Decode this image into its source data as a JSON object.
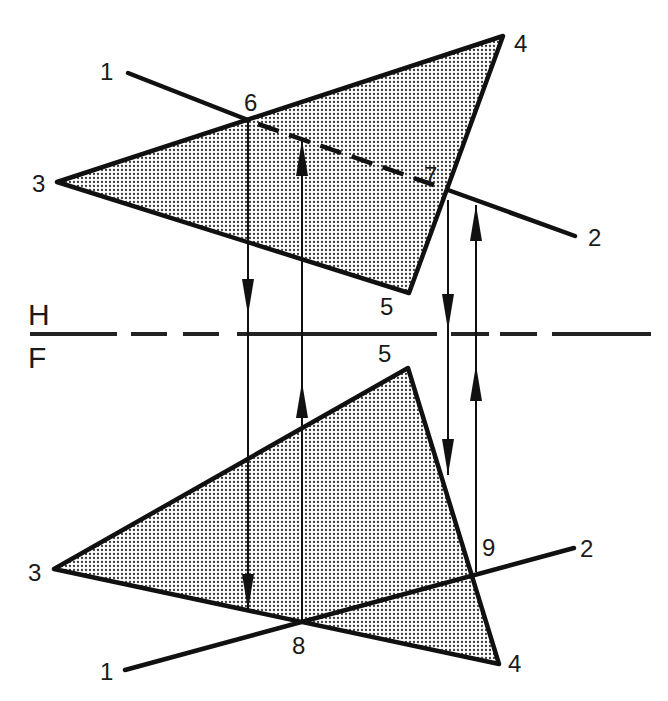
{
  "colors": {
    "ink": "#111111",
    "background": "#ffffff",
    "plane_fill_dot": "#3a3a3a"
  },
  "fold_line": {
    "upper_label": "H",
    "lower_label": "F",
    "y": 334,
    "dashes": [
      [
        30,
        117
      ],
      [
        131,
        167
      ],
      [
        183,
        219
      ],
      [
        237,
        437
      ],
      [
        451,
        489
      ],
      [
        500,
        537
      ],
      [
        552,
        651
      ]
    ]
  },
  "top_view": {
    "view_name": "H",
    "plane": {
      "vertices": {
        "3": [
          57,
          182
        ],
        "4": [
          503,
          36
        ],
        "5": [
          409,
          293
        ]
      },
      "labels": {
        "3": {
          "text": "3",
          "x": 32,
          "y": 192
        },
        "4": {
          "text": "4",
          "x": 514,
          "y": 52
        },
        "5": {
          "text": "5",
          "x": 380,
          "y": 315
        }
      }
    },
    "line": {
      "start": [
        128,
        73
      ],
      "pierce_6": [
        248,
        120
      ],
      "exit_7": [
        448,
        190
      ],
      "end": [
        575,
        236
      ],
      "labels": {
        "1": {
          "text": "1",
          "x": 100,
          "y": 80
        },
        "2": {
          "text": "2",
          "x": 588,
          "y": 246
        },
        "6": {
          "text": "6",
          "x": 244,
          "y": 111
        },
        "7": {
          "text": "7",
          "x": 424,
          "y": 184
        }
      }
    }
  },
  "front_view": {
    "view_name": "F",
    "plane": {
      "vertices": {
        "3": [
          54,
          569
        ],
        "4": [
          499,
          664
        ],
        "5": [
          408,
          368
        ]
      },
      "labels": {
        "3": {
          "text": "3",
          "x": 28,
          "y": 581
        },
        "4": {
          "text": "4",
          "x": 508,
          "y": 672
        },
        "5": {
          "text": "5",
          "x": 378,
          "y": 362
        }
      }
    },
    "line": {
      "start": [
        125,
        670
      ],
      "point_8": [
        300,
        623
      ],
      "point_9": [
        474,
        577
      ],
      "end": [
        574,
        548
      ],
      "labels": {
        "1": {
          "text": "1",
          "x": 100,
          "y": 680
        },
        "2": {
          "text": "2",
          "x": 580,
          "y": 557
        },
        "8": {
          "text": "8",
          "x": 292,
          "y": 654
        },
        "9": {
          "text": "9",
          "x": 482,
          "y": 556
        }
      }
    }
  },
  "projectors": [
    {
      "id": "6-down",
      "x": 248,
      "y1": 120,
      "y2": 610,
      "heads": [
        {
          "dir": "down",
          "tip": 315
        },
        {
          "dir": "down",
          "tip": 610
        }
      ]
    },
    {
      "id": "8-up",
      "x": 302,
      "y1": 140,
      "y2": 623,
      "heads": [
        {
          "dir": "up",
          "tip": 382
        },
        {
          "dir": "up",
          "tip": 140
        }
      ]
    },
    {
      "id": "7-down",
      "x": 448,
      "y1": 200,
      "y2": 475,
      "heads": [
        {
          "dir": "down",
          "tip": 330
        },
        {
          "dir": "down",
          "tip": 475
        }
      ]
    },
    {
      "id": "9-up",
      "x": 476,
      "y1": 205,
      "y2": 572,
      "heads": [
        {
          "dir": "up",
          "tip": 365
        },
        {
          "dir": "up",
          "tip": 205
        }
      ]
    }
  ]
}
